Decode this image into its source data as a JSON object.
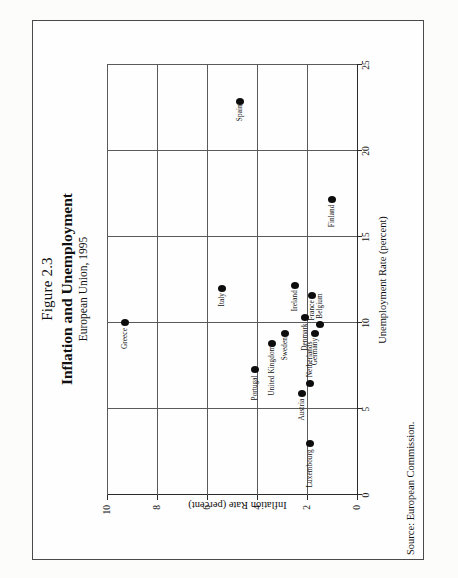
{
  "figure": {
    "number_label": "Figure 2.3",
    "title": "Inflation and Unemployment",
    "subtitle": "European Union, 1995",
    "source": "Source:  European Commission."
  },
  "chart_data": {
    "type": "scatter",
    "title": "Inflation and Unemployment",
    "subtitle": "European Union, 1995",
    "xlabel": "Unemployment Rate (percent)",
    "ylabel": "Inflation Rate (percent)",
    "xlim": [
      0,
      25
    ],
    "ylim": [
      0,
      10
    ],
    "xticks": [
      "0",
      "5",
      "10",
      "15",
      "20",
      "25"
    ],
    "yticks": [
      "0",
      "2",
      "4",
      "6",
      "8",
      "10"
    ],
    "xtick_values": [
      0,
      5,
      10,
      15,
      20,
      25
    ],
    "ytick_values": [
      0,
      2,
      4,
      6,
      8,
      10
    ],
    "grid": true,
    "legend": "none",
    "marker": "filled-circle",
    "marker_color": "#0d0d0d",
    "points": [
      {
        "label": "Greece",
        "x": 10.0,
        "y": 9.3,
        "lx": -26,
        "ly": -4
      },
      {
        "label": "Italy",
        "x": 12.0,
        "y": 5.4,
        "lx": -18,
        "ly": -4
      },
      {
        "label": "Spain",
        "x": 22.9,
        "y": 4.7,
        "lx": -20,
        "ly": -4
      },
      {
        "label": "Portugal",
        "x": 7.3,
        "y": 4.1,
        "lx": -31,
        "ly": -4
      },
      {
        "label": "United Kingdom",
        "x": 8.8,
        "y": 3.4,
        "lx": -52,
        "ly": -4
      },
      {
        "label": "Sweden",
        "x": 9.4,
        "y": 2.9,
        "lx": -27,
        "ly": -4
      },
      {
        "label": "Ireland",
        "x": 12.2,
        "y": 2.5,
        "lx": -26,
        "ly": -4
      },
      {
        "label": "Denmark",
        "x": 10.3,
        "y": 2.1,
        "lx": -33,
        "ly": -4
      },
      {
        "label": "France",
        "x": 11.6,
        "y": 1.8,
        "lx": -25,
        "ly": -4
      },
      {
        "label": "Germany",
        "x": 9.4,
        "y": 1.7,
        "lx": -32,
        "ly": -4
      },
      {
        "label": "Belgium",
        "x": 9.9,
        "y": 1.5,
        "lx": 6,
        "ly": -4
      },
      {
        "label": "Austria",
        "x": 5.9,
        "y": 2.2,
        "lx": -27,
        "ly": -4
      },
      {
        "label": "Netherlands",
        "x": 6.5,
        "y": 1.9,
        "lx": 6,
        "ly": -4
      },
      {
        "label": "Finland",
        "x": 17.2,
        "y": 1.0,
        "lx": -28,
        "ly": -4
      },
      {
        "label": "Luxembourg",
        "x": 3.0,
        "y": 1.9,
        "lx": -44,
        "ly": -4
      }
    ]
  }
}
